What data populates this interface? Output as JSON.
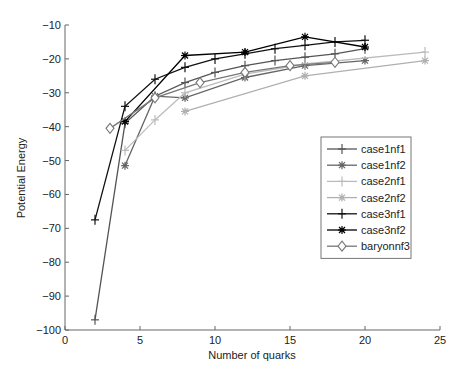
{
  "chart_data": {
    "type": "line",
    "title": "",
    "xlabel": "Number of quarks",
    "ylabel": "Potential Energy",
    "xlim": [
      0,
      25
    ],
    "ylim": [
      -100,
      -10
    ],
    "xticks": [
      0,
      5,
      10,
      15,
      20,
      25
    ],
    "yticks": [
      -10,
      -20,
      -30,
      -40,
      -50,
      -60,
      -70,
      -80,
      -90,
      -100
    ],
    "grid": false,
    "legend_position": "right-center",
    "series": [
      {
        "name": "case1nf1",
        "color": "#555555",
        "marker": "plus",
        "x": [
          2,
          4,
          6,
          8,
          10,
          12,
          14,
          16,
          18,
          20
        ],
        "y": [
          -97,
          -39,
          -31,
          -27,
          -24,
          -22,
          -20.5,
          -19.5,
          -18.5,
          -17
        ]
      },
      {
        "name": "case1nf2",
        "color": "#666666",
        "marker": "star",
        "x": [
          4,
          6,
          8,
          12,
          16,
          20
        ],
        "y": [
          -51.5,
          -31,
          -31.5,
          -25.5,
          -22,
          -20.5
        ]
      },
      {
        "name": "case2nf1",
        "color": "#bbbbbb",
        "marker": "plus",
        "x": [
          4,
          6,
          8,
          12,
          16,
          24
        ],
        "y": [
          -47,
          -38,
          -30,
          -24.5,
          -21.5,
          -18
        ]
      },
      {
        "name": "case2nf2",
        "color": "#b0b0b0",
        "marker": "star",
        "x": [
          8,
          16,
          24
        ],
        "y": [
          -35.5,
          -25,
          -20.5
        ]
      },
      {
        "name": "case3nf1",
        "color": "#111111",
        "marker": "plus",
        "x": [
          2,
          4,
          6,
          8,
          10,
          12,
          14,
          16,
          18,
          20
        ],
        "y": [
          -67.5,
          -34,
          -26,
          -22.5,
          -20,
          -18.5,
          -17,
          -16,
          -15,
          -14.5
        ]
      },
      {
        "name": "case3nf2",
        "color": "#000000",
        "marker": "star",
        "x": [
          4,
          8,
          12,
          16,
          20
        ],
        "y": [
          -38.5,
          -19,
          -18,
          -13.5,
          -16.5
        ]
      },
      {
        "name": "baryonnf3",
        "color": "#777777",
        "marker": "diamond",
        "x": [
          3,
          6,
          9,
          12,
          15,
          18
        ],
        "y": [
          -40.5,
          -31.5,
          -27,
          -24,
          -22,
          -21
        ]
      }
    ]
  }
}
